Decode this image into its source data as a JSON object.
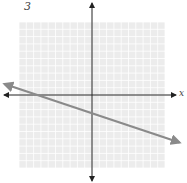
{
  "problem_number": "3",
  "chart_data": {
    "type": "line",
    "title": "",
    "xlabel": "x",
    "ylabel": "y",
    "xlim": [
      -10,
      10
    ],
    "ylim": [
      -10,
      10
    ],
    "grid": true,
    "grid_step": 1,
    "series": [
      {
        "name": "line",
        "slope": -0.333,
        "y_intercept": -2.5,
        "x_intercept": -7.5,
        "x": [
          -12,
          12
        ],
        "y": [
          1.5,
          -6.5
        ],
        "color": "#8a8a8a"
      }
    ]
  },
  "colors": {
    "grid_bg": "#ececec",
    "grid_line": "#ffffff",
    "axis": "#222222",
    "line": "#8a8a8a"
  }
}
